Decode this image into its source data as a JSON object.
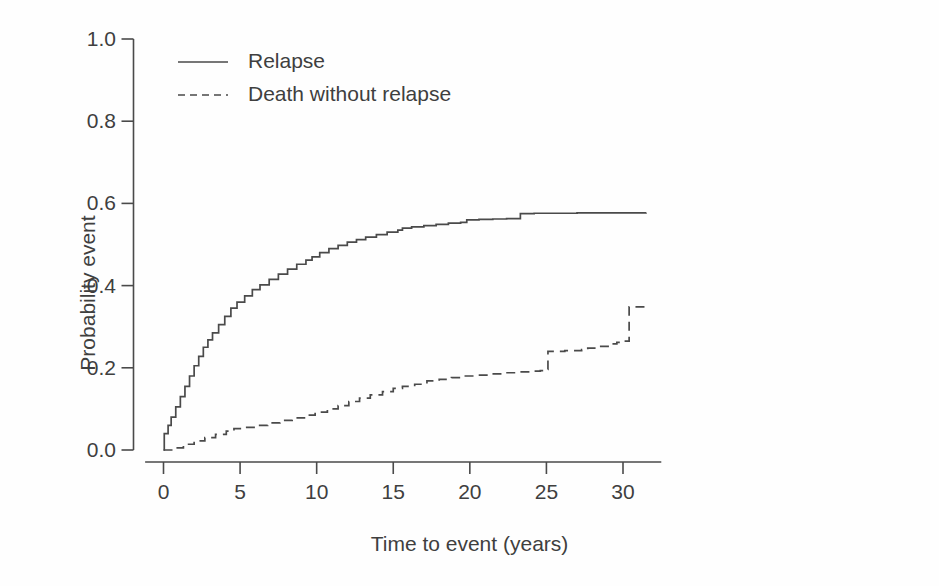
{
  "chart_data": {
    "type": "line",
    "title": "",
    "subtitle": "",
    "xlabel": "Time to event (years)",
    "ylabel": "Probability event",
    "xlim": [
      -1.2,
      32.5
    ],
    "ylim": [
      -0.04,
      1.05
    ],
    "xticks": [
      0,
      5,
      10,
      15,
      20,
      25,
      30
    ],
    "xtick_labels": [
      "0",
      "5",
      "10",
      "15",
      "20",
      "25",
      "30"
    ],
    "yticks": [
      0.0,
      0.2,
      0.4,
      0.6,
      0.8,
      1.0
    ],
    "ytick_labels": [
      "0.0",
      "0.2",
      "0.4",
      "0.6",
      "0.8",
      "1.0"
    ],
    "grid": false,
    "legend_position": "top-left-inside",
    "line_color": "#4a4a4a",
    "axis_color": "#4a4a4a",
    "background": "#fefefe",
    "series": [
      {
        "name": "Relapse",
        "style": "solid",
        "color": "#4a4a4a",
        "x": [
          0.0,
          0.05,
          0.3,
          0.5,
          0.8,
          1.1,
          1.4,
          1.7,
          2.0,
          2.3,
          2.6,
          2.9,
          3.2,
          3.6,
          4.0,
          4.4,
          4.8,
          5.3,
          5.8,
          6.3,
          6.9,
          7.5,
          8.1,
          8.7,
          9.3,
          9.7,
          10.2,
          10.8,
          11.4,
          12.0,
          12.6,
          13.2,
          13.9,
          14.6,
          15.3,
          15.6,
          16.2,
          17.0,
          17.8,
          18.6,
          19.4,
          19.8,
          20.6,
          21.5,
          22.4,
          23.3,
          24.2,
          25.5,
          27.0,
          29.0,
          31.5
        ],
        "y": [
          0.0,
          0.04,
          0.06,
          0.08,
          0.105,
          0.13,
          0.155,
          0.18,
          0.205,
          0.228,
          0.25,
          0.268,
          0.285,
          0.305,
          0.325,
          0.345,
          0.36,
          0.375,
          0.39,
          0.402,
          0.415,
          0.428,
          0.44,
          0.452,
          0.462,
          0.47,
          0.48,
          0.49,
          0.498,
          0.506,
          0.512,
          0.518,
          0.524,
          0.53,
          0.535,
          0.54,
          0.543,
          0.546,
          0.549,
          0.552,
          0.554,
          0.56,
          0.561,
          0.562,
          0.563,
          0.575,
          0.576,
          0.576,
          0.577,
          0.577,
          0.578
        ]
      },
      {
        "name": "Death without relapse",
        "style": "dashed",
        "color": "#4a4a4a",
        "x": [
          0.0,
          0.6,
          1.3,
          2.0,
          2.7,
          3.4,
          4.1,
          4.6,
          5.2,
          6.0,
          6.8,
          7.6,
          8.4,
          9.2,
          9.9,
          10.7,
          11.4,
          12.1,
          12.8,
          13.5,
          14.3,
          15.0,
          15.6,
          16.4,
          17.2,
          18.0,
          18.8,
          19.6,
          20.4,
          21.3,
          22.2,
          23.1,
          24.0,
          24.6,
          24.9,
          25.1,
          26.2,
          27.3,
          27.7,
          28.4,
          29.3,
          29.6,
          29.9,
          30.4,
          31.5
        ],
        "y": [
          0.0,
          0.005,
          0.014,
          0.022,
          0.03,
          0.038,
          0.046,
          0.052,
          0.055,
          0.06,
          0.066,
          0.072,
          0.078,
          0.085,
          0.092,
          0.1,
          0.108,
          0.118,
          0.126,
          0.134,
          0.142,
          0.15,
          0.155,
          0.16,
          0.168,
          0.172,
          0.176,
          0.18,
          0.182,
          0.185,
          0.188,
          0.19,
          0.192,
          0.193,
          0.196,
          0.24,
          0.242,
          0.244,
          0.248,
          0.252,
          0.258,
          0.262,
          0.265,
          0.348,
          0.35
        ]
      }
    ]
  },
  "legend": {
    "items": [
      {
        "label": "Relapse",
        "style": "solid"
      },
      {
        "label": "Death without relapse",
        "style": "dashed"
      }
    ]
  }
}
